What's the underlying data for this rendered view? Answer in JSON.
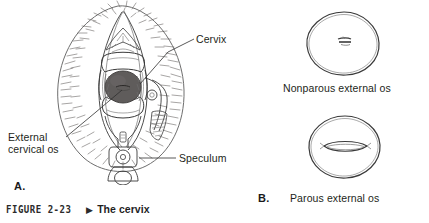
{
  "figure": {
    "caption_number": "FIGURE 2-23",
    "caption_marker": "▶",
    "caption_title": "The cervix"
  },
  "panels": [
    {
      "letter": "A.",
      "name": "speculum-examination",
      "callouts": [
        {
          "id": "cervix",
          "label": "Cervix"
        },
        {
          "id": "external-cervical-os",
          "label_line1": "External",
          "label_line2": "cervical os"
        },
        {
          "id": "speculum",
          "label": "Speculum"
        }
      ]
    },
    {
      "letter": "B.",
      "name": "external-os-comparison",
      "items": [
        {
          "id": "nonparous",
          "label": "Nonparous external os"
        },
        {
          "id": "parous",
          "label": "Parous external os"
        }
      ]
    }
  ],
  "colors": {
    "ink": "#3a3a3a",
    "ink_soft": "#6e6e6e",
    "cervix_fill": "#5f5c5b",
    "hair": "#5e5a58",
    "text": "#231f20",
    "background": "#ffffff"
  }
}
